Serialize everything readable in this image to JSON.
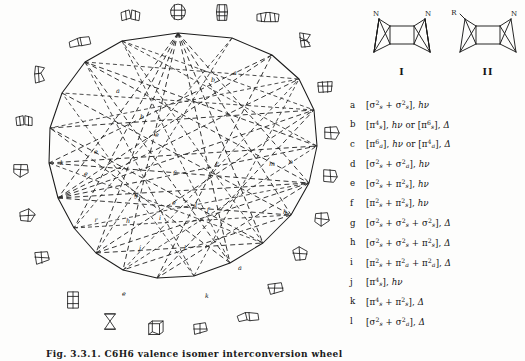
{
  "figure": {
    "caption": "Fig. 3.3.1. C6H6 valence isomer interconversion wheel",
    "domain": "chemistry-diagram"
  },
  "wheel": {
    "title": "valence-isomer interconversion wheel",
    "vertex_count": 20,
    "molecule_count": 20,
    "chord_labels": [
      {
        "id": "c1",
        "label": "a",
        "x": 118,
        "y": 91
      },
      {
        "id": "c2",
        "label": "b",
        "x": 142,
        "y": 117
      },
      {
        "id": "c3",
        "label": "b",
        "x": 213,
        "y": 80
      },
      {
        "id": "c4",
        "label": "a",
        "x": 235,
        "y": 73
      },
      {
        "id": "c5",
        "label": "e",
        "x": 157,
        "y": 135
      },
      {
        "id": "c6",
        "label": "e",
        "x": 96,
        "y": 152
      },
      {
        "id": "c7",
        "label": "k",
        "x": 62,
        "y": 163
      },
      {
        "id": "c8",
        "label": "e",
        "x": 86,
        "y": 174
      },
      {
        "id": "c9",
        "label": "g",
        "x": 136,
        "y": 195
      },
      {
        "id": "c10",
        "label": "c",
        "x": 175,
        "y": 172
      },
      {
        "id": "c11",
        "label": "r",
        "x": 217,
        "y": 164
      },
      {
        "id": "c12",
        "label": "m",
        "x": 272,
        "y": 164
      },
      {
        "id": "c13",
        "label": "o",
        "x": 291,
        "y": 162
      },
      {
        "id": "c14",
        "label": "e",
        "x": 174,
        "y": 203
      },
      {
        "id": "c15",
        "label": "l",
        "x": 196,
        "y": 205
      },
      {
        "id": "c16",
        "label": "r",
        "x": 96,
        "y": 220
      },
      {
        "id": "c17",
        "label": "h",
        "x": 128,
        "y": 221
      },
      {
        "id": "c18",
        "label": "f",
        "x": 208,
        "y": 210
      },
      {
        "id": "c19",
        "label": "h",
        "x": 285,
        "y": 212
      },
      {
        "id": "c20",
        "label": "i",
        "x": 160,
        "y": 218
      },
      {
        "id": "c21",
        "label": "j",
        "x": 140,
        "y": 248
      },
      {
        "id": "c22",
        "label": "l",
        "x": 185,
        "y": 248
      },
      {
        "id": "c23",
        "label": "a",
        "x": 240,
        "y": 268
      },
      {
        "id": "c24",
        "label": "e",
        "x": 124,
        "y": 294
      },
      {
        "id": "c25",
        "label": "k",
        "x": 207,
        "y": 296
      }
    ]
  },
  "structures": [
    {
      "id": "I",
      "name": "diazabicyclic-cage-I",
      "caption": "I",
      "labels": [
        "N",
        "N"
      ]
    },
    {
      "id": "II",
      "name": "azabicyclic-cage-II",
      "caption": "II",
      "labels": [
        "R",
        "N"
      ]
    }
  ],
  "legend": {
    "title": "reaction-type key",
    "entries": [
      {
        "key": "a",
        "formula": "[σ2s + σ2s], hν",
        "terms": [
          {
            "g": "σ",
            "sup": "2",
            "sub": "s"
          },
          {
            "g": "σ",
            "sup": "2",
            "sub": "s"
          }
        ],
        "conditions": [
          "hν"
        ]
      },
      {
        "key": "b",
        "formula": "[π4s], hν or [π6s], Δ",
        "terms": [
          {
            "g": "π",
            "sup": "4",
            "sub": "s"
          }
        ],
        "conditions": [
          "hν",
          "Δ"
        ]
      },
      {
        "key": "c",
        "formula": "[π6a], hν or [π4a], Δ",
        "terms": [
          {
            "g": "π",
            "sup": "6",
            "sub": "a"
          }
        ],
        "conditions": [
          "hν",
          "Δ"
        ]
      },
      {
        "key": "d",
        "formula": "[σ2s + σ2a], hν",
        "terms": [
          {
            "g": "σ",
            "sup": "2",
            "sub": "s"
          },
          {
            "g": "σ",
            "sup": "2",
            "sub": "a"
          }
        ],
        "conditions": [
          "hν"
        ]
      },
      {
        "key": "e",
        "formula": "[σ2s + π2s], hν",
        "terms": [
          {
            "g": "σ",
            "sup": "2",
            "sub": "s"
          },
          {
            "g": "π",
            "sup": "2",
            "sub": "s"
          }
        ],
        "conditions": [
          "hν"
        ]
      },
      {
        "key": "f",
        "formula": "[π2s + π2s], hν",
        "terms": [
          {
            "g": "π",
            "sup": "2",
            "sub": "s"
          },
          {
            "g": "π",
            "sup": "2",
            "sub": "s"
          }
        ],
        "conditions": [
          "hν"
        ]
      },
      {
        "key": "g",
        "formula": "[σ2s + σ2s + σ2s], Δ",
        "terms": [
          {
            "g": "σ",
            "sup": "2",
            "sub": "s"
          },
          {
            "g": "σ",
            "sup": "2",
            "sub": "s"
          },
          {
            "g": "σ",
            "sup": "2",
            "sub": "s"
          }
        ],
        "conditions": [
          "Δ"
        ]
      },
      {
        "key": "h",
        "formula": "[σ2s + σ2s + π2s], Δ",
        "terms": [
          {
            "g": "σ",
            "sup": "2",
            "sub": "s"
          },
          {
            "g": "σ",
            "sup": "2",
            "sub": "s"
          },
          {
            "g": "π",
            "sup": "2",
            "sub": "s"
          }
        ],
        "conditions": [
          "Δ"
        ]
      },
      {
        "key": "i",
        "formula": "[π2s + π2a + π2a], Δ",
        "terms": [
          {
            "g": "π",
            "sup": "2",
            "sub": "s"
          },
          {
            "g": "π",
            "sup": "2",
            "sub": "a"
          },
          {
            "g": "π",
            "sup": "2",
            "sub": "a"
          }
        ],
        "conditions": [
          "Δ"
        ]
      },
      {
        "key": "j",
        "formula": "[π4s], hν",
        "terms": [
          {
            "g": "π",
            "sup": "4",
            "sub": "s"
          }
        ],
        "conditions": [
          "hν"
        ]
      },
      {
        "key": "k",
        "formula": "[π4s + π2s], Δ",
        "terms": [
          {
            "g": "π",
            "sup": "4",
            "sub": "s"
          },
          {
            "g": "π",
            "sup": "2",
            "sub": "s"
          }
        ],
        "conditions": [
          "Δ"
        ]
      },
      {
        "key": "l",
        "formula": "[σ2s + σ2a], Δ",
        "terms": [
          {
            "g": "σ",
            "sup": "2",
            "sub": "s"
          },
          {
            "g": "σ",
            "sup": "2",
            "sub": "a"
          }
        ],
        "conditions": [
          "Δ"
        ]
      }
    ]
  },
  "glyphs": {
    "sigma": "σ",
    "pi": "π",
    "delta": "Δ",
    "hv": "hν",
    "bracket_open": "[",
    "bracket_close": "]",
    "plus": "+"
  }
}
